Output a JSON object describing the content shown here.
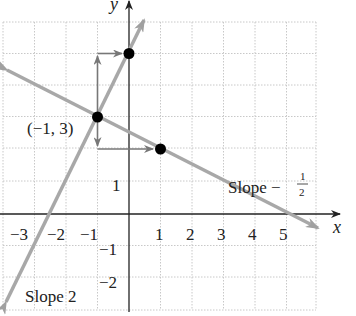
{
  "figure": {
    "type": "coordinate-plane",
    "axes": {
      "x_label": "x",
      "y_label": "y",
      "x_ticks": [
        "−3",
        "−2",
        "−1",
        "1",
        "2",
        "3",
        "4",
        "5"
      ],
      "y_ticks": [
        "1",
        "−1",
        "−2"
      ]
    },
    "lines": [
      {
        "name": "slope-2-line",
        "label": "Slope 2",
        "slope": 2,
        "through": [
          -1,
          3
        ],
        "color": "#a8a8a8"
      },
      {
        "name": "slope-neg-half-line",
        "label_prefix": "Slope −",
        "label_num": "1",
        "label_den": "2",
        "slope": -0.5,
        "through": [
          -1,
          3
        ],
        "color": "#a8a8a8"
      }
    ],
    "points": [
      {
        "coords": [
          -1,
          3
        ],
        "label": "(−1, 3)"
      },
      {
        "coords": [
          0,
          5
        ]
      },
      {
        "coords": [
          1,
          2
        ]
      }
    ],
    "rise_run_arrows": [
      {
        "from": [
          -1,
          3
        ],
        "up": 2,
        "right": 1
      },
      {
        "from": [
          -1,
          3
        ],
        "down": 1,
        "right": 2
      }
    ],
    "colors": {
      "axis": "#222222",
      "grid": "#c8c8c8",
      "line": "#a8a8a8",
      "point": "#000000",
      "arrow": "#777777"
    }
  }
}
